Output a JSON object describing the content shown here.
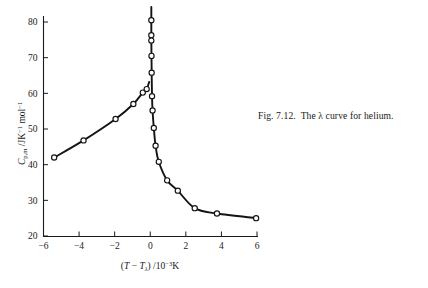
{
  "caption": {
    "figure_number": "Fig. 7.12.",
    "text": "The λ curve for helium.",
    "full": "Fig. 7.12.  The λ curve for helium."
  },
  "chart_data": {
    "type": "line",
    "title": "",
    "xlabel": "(T − Tλ) /10⁻³K",
    "ylabel": "C p,m /JK⁻¹ mol⁻¹",
    "xlabel_parts": {
      "open_paren": "(",
      "t_symbol": "T",
      "minus": "−",
      "t_lambda_symbol": "T",
      "t_lambda_sub": "λ",
      "close_paren": ")",
      "slash_units": "/10",
      "exponent": "−3",
      "kelvin": "K"
    },
    "ylabel_parts": {
      "c_symbol": "C",
      "c_sub": "p,m",
      "slash": "/JK",
      "exp1": "−1",
      "mol": "mol",
      "exp2": "−1"
    },
    "xlim": [
      -6,
      6
    ],
    "ylim": [
      20,
      84
    ],
    "xticks": [
      -6,
      -4,
      -2,
      0,
      2,
      4,
      6
    ],
    "xtick_labels": [
      "−6",
      "−4",
      "−2",
      "0",
      "2",
      "4",
      "6"
    ],
    "yticks": [
      20,
      30,
      40,
      50,
      60,
      70,
      80
    ],
    "ytick_labels": [
      "20",
      "30",
      "40",
      "50",
      "60",
      "70",
      "80"
    ],
    "grid": false,
    "legend": null,
    "marker_style": "open-circle",
    "series": [
      {
        "name": "Heat capacity of helium near the lambda transition",
        "branch": "below-lambda",
        "points": [
          {
            "x": -5.4,
            "y": 42.0
          },
          {
            "x": -3.75,
            "y": 46.8
          },
          {
            "x": -1.95,
            "y": 52.8
          },
          {
            "x": -0.95,
            "y": 57.0
          },
          {
            "x": -0.42,
            "y": 60.2
          },
          {
            "x": -0.2,
            "y": 61.2
          }
        ]
      },
      {
        "name": "Heat capacity of helium near the lambda transition",
        "branch": "above-lambda",
        "points": [
          {
            "x": 0.06,
            "y": 84.2
          },
          {
            "x": 0.06,
            "y": 80.5
          },
          {
            "x": 0.06,
            "y": 76.3
          },
          {
            "x": 0.06,
            "y": 74.8
          },
          {
            "x": 0.07,
            "y": 70.5
          },
          {
            "x": 0.08,
            "y": 65.8
          },
          {
            "x": 0.1,
            "y": 59.2
          },
          {
            "x": 0.13,
            "y": 55.2
          },
          {
            "x": 0.2,
            "y": 50.3
          },
          {
            "x": 0.3,
            "y": 45.3
          },
          {
            "x": 0.48,
            "y": 40.8
          },
          {
            "x": 0.95,
            "y": 35.6
          },
          {
            "x": 1.55,
            "y": 32.7
          },
          {
            "x": 2.5,
            "y": 27.8
          },
          {
            "x": 3.75,
            "y": 26.3
          },
          {
            "x": 5.95,
            "y": 25.0
          }
        ]
      }
    ]
  }
}
